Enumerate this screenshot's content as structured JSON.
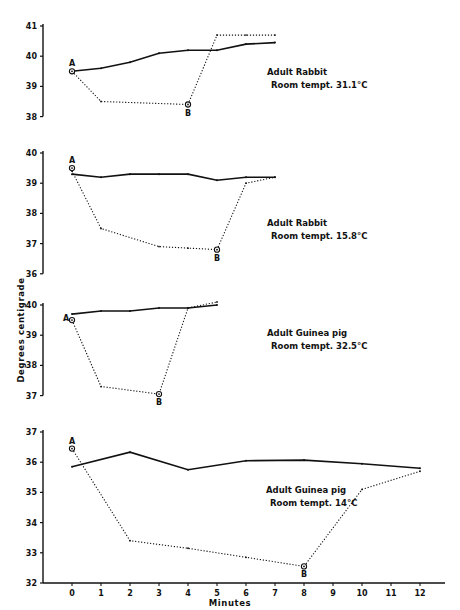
{
  "chart_data": {
    "type": "line",
    "xlabel": "Minutes",
    "ylabel": "Degrees centigrade",
    "x_ticks": [
      0,
      1,
      2,
      3,
      4,
      5,
      6,
      7,
      8,
      9,
      10,
      11,
      12
    ],
    "x_tick_labels": [
      "0",
      "1",
      "2",
      "3",
      "4",
      "5",
      "6",
      "7",
      "8",
      "9",
      "10",
      "11",
      "12"
    ],
    "legend": {
      "solid": "Control (solid line)",
      "dotted": "Experimental (dotted line), A = start, B = end of exposure"
    },
    "panels": [
      {
        "title": "Adult Rabbit",
        "subtitle": "Room tempt. 31.1°C",
        "ylim": [
          38,
          41
        ],
        "yticks": [
          38,
          39,
          40,
          41
        ],
        "series": [
          {
            "name": "solid",
            "x": [
              0,
              1,
              2,
              3,
              4,
              5,
              6,
              7
            ],
            "values": [
              39.5,
              39.6,
              39.8,
              40.1,
              40.2,
              40.2,
              40.4,
              40.45
            ]
          },
          {
            "name": "dotted",
            "x": [
              0,
              1,
              4,
              5,
              6,
              7
            ],
            "values": [
              39.5,
              38.5,
              38.4,
              40.7,
              40.7,
              40.7
            ]
          }
        ],
        "annotations": [
          {
            "label": "A",
            "x": 0,
            "y": 39.5
          },
          {
            "label": "B",
            "x": 4,
            "y": 38.4
          }
        ]
      },
      {
        "title": "Adult Rabbit",
        "subtitle": "Room tempt. 15.8°C",
        "ylim": [
          36,
          40
        ],
        "yticks": [
          36,
          37,
          38,
          39,
          40
        ],
        "series": [
          {
            "name": "solid",
            "x": [
              0,
              1,
              2,
              3,
              4,
              5,
              6,
              7
            ],
            "values": [
              39.3,
              39.2,
              39.3,
              39.3,
              39.3,
              39.1,
              39.2,
              39.2
            ]
          },
          {
            "name": "dotted",
            "x": [
              0,
              1,
              3,
              4,
              5,
              6,
              7
            ],
            "values": [
              39.4,
              37.5,
              36.9,
              36.85,
              36.8,
              39.0,
              39.2
            ]
          }
        ],
        "annotations": [
          {
            "label": "A",
            "x": 0,
            "y": 39.5
          },
          {
            "label": "B",
            "x": 5,
            "y": 36.8
          }
        ]
      },
      {
        "title": "Adult Guinea pig",
        "subtitle": "Room tempt. 32.5°C",
        "ylim": [
          37,
          40
        ],
        "yticks": [
          37,
          38,
          39,
          40
        ],
        "series": [
          {
            "name": "solid",
            "x": [
              0,
              1,
              2,
              3,
              4,
              5
            ],
            "values": [
              39.7,
              39.8,
              39.8,
              39.9,
              39.9,
              40.0
            ]
          },
          {
            "name": "dotted",
            "x": [
              0,
              1,
              3,
              4,
              5
            ],
            "values": [
              39.5,
              37.3,
              37.05,
              39.9,
              40.1
            ]
          }
        ],
        "annotations": [
          {
            "label": "A",
            "x": 0,
            "y": 39.5
          },
          {
            "label": "B",
            "x": 3,
            "y": 37.05
          }
        ]
      },
      {
        "title": "Adult Guinea pig",
        "subtitle": "Room tempt. 14°C",
        "ylim": [
          32,
          37
        ],
        "yticks": [
          32,
          33,
          34,
          35,
          36,
          37
        ],
        "series": [
          {
            "name": "solid",
            "x": [
              0,
              2,
              4,
              6,
              8,
              10,
              12
            ],
            "values": [
              35.85,
              36.33,
              35.75,
              36.05,
              36.07,
              35.95,
              35.8
            ]
          },
          {
            "name": "dotted",
            "x": [
              0,
              2,
              4,
              6,
              8,
              10,
              12
            ],
            "values": [
              36.45,
              33.4,
              33.15,
              32.85,
              32.55,
              35.1,
              35.7
            ]
          }
        ],
        "annotations": [
          {
            "label": "A",
            "x": 0,
            "y": 36.45
          },
          {
            "label": "B",
            "x": 8,
            "y": 32.55
          }
        ]
      }
    ]
  }
}
